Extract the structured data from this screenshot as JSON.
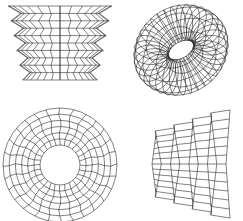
{
  "figure": {
    "line_color": "#1a1a1a",
    "background_color": "#ffffff",
    "panels": [
      {
        "id": "bellows-vertical",
        "label": "Vertical bellows (zig-zag) surface, front view",
        "folds": 5,
        "columns": 14,
        "taper": 0.72
      },
      {
        "id": "torus-oblique",
        "label": "Torus-like ring surface, oblique view",
        "rings": 8,
        "spokes": 36
      },
      {
        "id": "annulus-polar",
        "label": "Annular disk polar grid, top view",
        "rings": 7,
        "spokes": 28,
        "inner_ratio": 0.35
      },
      {
        "id": "bellows-horizontal",
        "label": "Horizontal bellows (zig-zag) surface, side view",
        "folds": 4,
        "rows": 12
      }
    ]
  }
}
